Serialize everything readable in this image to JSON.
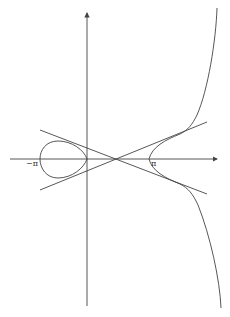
{
  "diagram": {
    "type": "curve-plot",
    "labels": {
      "neg_pi": "−π",
      "pi": "π"
    },
    "colors": {
      "stroke": "#444444",
      "background": "#ffffff"
    },
    "axes": {
      "horizontal": {
        "from": [
          10,
          159
        ],
        "to": [
          218,
          159
        ],
        "arrow": true
      },
      "vertical": {
        "from": [
          87,
          306
        ],
        "to": [
          87,
          12
        ],
        "arrow": true
      }
    },
    "lines": [
      {
        "name": "asymptote-upper",
        "from": [
          40,
          130
        ],
        "to": [
          207,
          122
        ]
      },
      {
        "name": "asymptote-lower",
        "from": [
          40,
          190
        ],
        "to": [
          207,
          194
        ]
      }
    ],
    "node": [
      116,
      159
    ]
  }
}
